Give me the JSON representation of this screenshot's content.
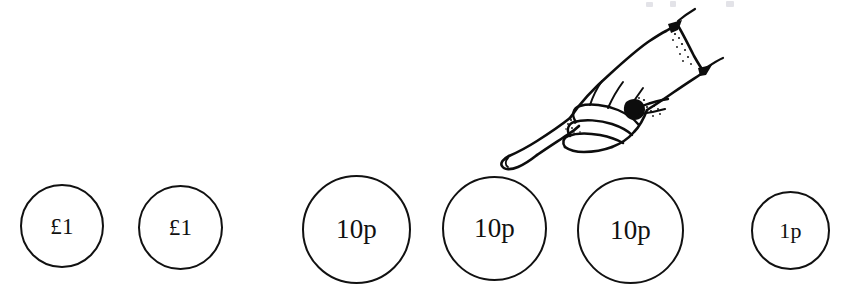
{
  "scene": {
    "width": 843,
    "height": 297,
    "background_color": "#ffffff",
    "ink_color": "#111111",
    "description": "Line-drawing worksheet image: a row of six drawn coins with a pointing hand above the fifth coin"
  },
  "coins": [
    {
      "label": "£1",
      "denomination": "1 pound",
      "left": 20,
      "top": 184,
      "size": 84,
      "font_size": 23
    },
    {
      "label": "£1",
      "denomination": "1 pound",
      "left": 138,
      "top": 185,
      "size": 85,
      "font_size": 23
    },
    {
      "label": "10p",
      "denomination": "10 pence",
      "left": 302,
      "top": 175,
      "size": 109,
      "font_size": 27
    },
    {
      "label": "10p",
      "denomination": "10 pence",
      "left": 442,
      "top": 176,
      "size": 105,
      "font_size": 27
    },
    {
      "label": "10p",
      "denomination": "10 pence",
      "left": 577,
      "top": 177,
      "size": 107,
      "font_size": 27
    },
    {
      "label": "1p",
      "denomination": "1 penny",
      "left": 751,
      "top": 191,
      "size": 79,
      "font_size": 22
    }
  ],
  "hand": {
    "name": "pointing-hand-illustration",
    "description": "Ink line drawing of a right hand, fist closed with the index finger extended pointing down-left toward the coins, shirt cuff at the upper right",
    "stroke_color": "#0d0d0d"
  },
  "crop_marks": {
    "description": "Faint cut-off marks of text at the very top edge of the scan",
    "color": "#e3e3e8",
    "marks": [
      {
        "left": 6,
        "top": 2,
        "width": 7,
        "height": 5
      },
      {
        "left": 30,
        "top": 1,
        "width": 6,
        "height": 6
      },
      {
        "left": 86,
        "top": 1,
        "width": 8,
        "height": 6
      }
    ]
  }
}
